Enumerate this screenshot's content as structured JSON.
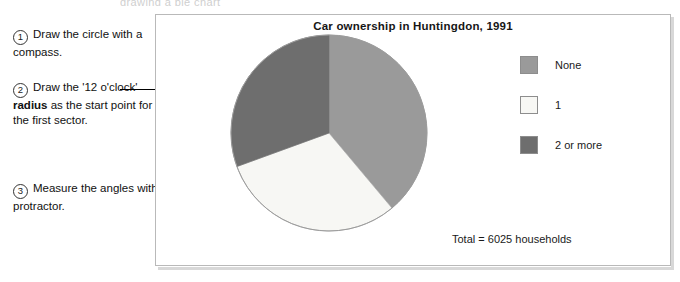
{
  "top_sliver_text": "drawing a pie chart",
  "annotations": [
    {
      "number": "1",
      "text": "Draw the circle with a compass.",
      "bold_part": ""
    },
    {
      "number": "2",
      "text_before": "Draw the '12 o'clock' ",
      "bold_part": "radius",
      "text_after": " as the start point for the first sector."
    },
    {
      "number": "3",
      "text": "Measure the angles with a protractor.",
      "bold_part": ""
    }
  ],
  "pointer": {
    "name": "arrow-to-twelve-oclock-radius",
    "from_x": 120,
    "to_x": 327,
    "y": 89
  },
  "panel": {
    "total_text": "Total = 6025 households"
  },
  "chart_data": {
    "type": "pie",
    "title": "Car ownership in Huntingdon, 1991",
    "subtitle": "",
    "xlabel": "",
    "ylabel": "",
    "total": 6025,
    "total_label": "Total = 6025 households",
    "units": "households",
    "start_angle_deg": 0,
    "direction": "clockwise",
    "legend_position": "right",
    "grid": false,
    "categories": [
      "None",
      "1",
      "2 or more"
    ],
    "values": [
      2343,
      1841,
      1841
    ],
    "percentages": [
      38.9,
      30.6,
      30.6
    ],
    "angles_deg": [
      140,
      110,
      110
    ],
    "colors": [
      "#9a9a9a",
      "#f7f7f4",
      "#6e6e6e"
    ],
    "slices": [
      {
        "label": "None",
        "value": 2343,
        "percent": 38.9,
        "angle_deg": 140,
        "color": "#9a9a9a",
        "start_deg": 0,
        "end_deg": 140
      },
      {
        "label": "1",
        "value": 1841,
        "percent": 30.6,
        "angle_deg": 110,
        "color": "#f7f7f4",
        "start_deg": 140,
        "end_deg": 250
      },
      {
        "label": "2 or more",
        "value": 1841,
        "percent": 30.6,
        "angle_deg": 110,
        "color": "#6e6e6e",
        "start_deg": 250,
        "end_deg": 360
      }
    ]
  }
}
